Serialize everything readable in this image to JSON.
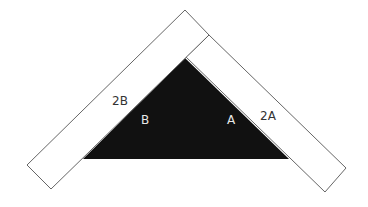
{
  "diagram": {
    "type": "geometric-diagram",
    "background": "#ffffff",
    "triangle": {
      "fill": "#111111",
      "points": [
        [
          185,
          58
        ],
        [
          83,
          159
        ],
        [
          289,
          159
        ]
      ]
    },
    "strip_left": {
      "stroke": "#555555",
      "fill": "#ffffff",
      "points": [
        [
          185,
          10
        ],
        [
          209,
          35
        ],
        [
          51,
          189
        ],
        [
          27,
          165
        ]
      ]
    },
    "strip_right": {
      "stroke": "#555555",
      "fill": "#ffffff",
      "points": [
        [
          209,
          35
        ],
        [
          346,
          168
        ],
        [
          325,
          193
        ],
        [
          185,
          58
        ]
      ]
    },
    "labels": {
      "label_2b": "2B",
      "label_b": "B",
      "label_a": "A",
      "label_2a": "2A"
    },
    "colors": {
      "dark_text": "#333333",
      "light_text": "#e8e8e8"
    }
  }
}
